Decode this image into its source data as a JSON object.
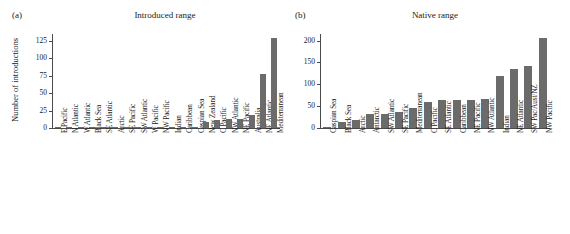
{
  "figure": {
    "panel_a_label": "(a)",
    "panel_b_label": "(b)"
  },
  "chart_data": [
    {
      "type": "bar",
      "title": "Introduced range",
      "panel": "(a)",
      "xlabel": "",
      "ylabel": "Number of introductions",
      "ylim": [
        0,
        135
      ],
      "yticks": [
        0,
        25,
        50,
        75,
        100,
        125
      ],
      "ytick_labels": [
        "0",
        "25",
        "50",
        "75",
        "100",
        "125"
      ],
      "grid": false,
      "legend": "none",
      "bar_color": "#6b6b6b",
      "categories": [
        "E Pacific",
        "N Atlantic",
        "W Atlantic",
        "Black Sea",
        "SE Atlantic",
        "Arctic",
        "SE Pacific",
        "SW Atlantic",
        "W Pacific",
        "NW Pacific",
        "Indian",
        "Caribbean",
        "Caspian Sea",
        "New Zealand",
        "C Pacific",
        "NW Atlantic",
        "NE Pacific",
        "Australia",
        "NE Atlantic",
        "Mediterranean"
      ],
      "values": [
        1,
        1,
        1,
        1,
        1,
        1,
        1,
        1,
        1,
        1,
        2,
        2,
        2,
        8,
        12,
        13,
        13,
        18,
        77,
        129
      ]
    },
    {
      "type": "bar",
      "title": "Native range",
      "panel": "(b)",
      "xlabel": "",
      "ylabel": "",
      "ylim": [
        0,
        215
      ],
      "yticks": [
        0,
        50,
        100,
        150,
        200
      ],
      "ytick_labels": [
        "0",
        "50",
        "100",
        "150",
        "200"
      ],
      "grid": false,
      "legend": "none",
      "bar_color": "#6b6b6b",
      "categories": [
        "Caspian Sea",
        "Black Sea",
        "Arctic",
        "Antarctic",
        "SW Atlantic",
        "SE Pacific",
        "Mediterranean",
        "C Pacific",
        "SE Atlantic",
        "Caribbean",
        "NE Pacific",
        "NW Atlantic",
        "Indian",
        "NE Atlantic",
        "SW Pac/Aust/NZ",
        "NW Pacific"
      ],
      "values": [
        2,
        13,
        18,
        33,
        33,
        36,
        45,
        59,
        63,
        64,
        65,
        67,
        118,
        135,
        142,
        207
      ]
    }
  ]
}
